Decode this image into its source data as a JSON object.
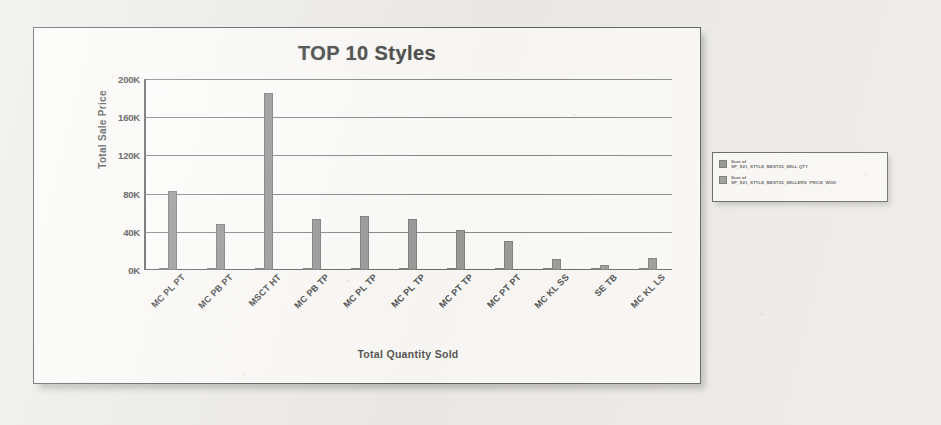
{
  "chart_data": {
    "type": "bar",
    "title": "TOP 10 Styles",
    "xlabel": "Total Quantity Sold",
    "ylabel": "Total Sale Price",
    "ylim": [
      0,
      200000
    ],
    "ytick_labels": [
      "0K",
      "40K",
      "80K",
      "120K",
      "160K",
      "200K"
    ],
    "ytick_values": [
      0,
      40000,
      80000,
      120000,
      160000,
      200000
    ],
    "grid": true,
    "legend_position": "right",
    "categories": [
      "MC PL PT",
      "MC PB PT",
      "MSCT HT",
      "MC PB TP",
      "MC PL TP",
      "MC PL TP",
      "MC PT TP",
      "MC PT PT",
      "MC KL SS",
      "SE TB",
      "MC KL LS"
    ],
    "series": [
      {
        "name": "Sum of SP_S21_STYLE_BEST25_SELL QTY",
        "color": "#6f6f6f",
        "values": [
          900,
          700,
          1100,
          800,
          700,
          800,
          600,
          700,
          200,
          100,
          200
        ]
      },
      {
        "name": "Sum of SP_S21_STYLE_BEST25_SELLERS_PRICE_WGD",
        "color": "#7d7d7d",
        "values": [
          83000,
          48000,
          185000,
          53000,
          57000,
          53000,
          42000,
          30000,
          12000,
          5000,
          13000
        ]
      }
    ]
  },
  "legend": {
    "entries": [
      {
        "line1": "Sum of",
        "line2": "SP_S21_STYLE_BEST25_SELL QTY",
        "swatch": "#6f6f6f"
      },
      {
        "line1": "Sum of",
        "line2": "SP_S21_STYLE_BEST25_SELLERS_PRICE_WGD",
        "swatch": "#7d7d7d"
      }
    ]
  }
}
